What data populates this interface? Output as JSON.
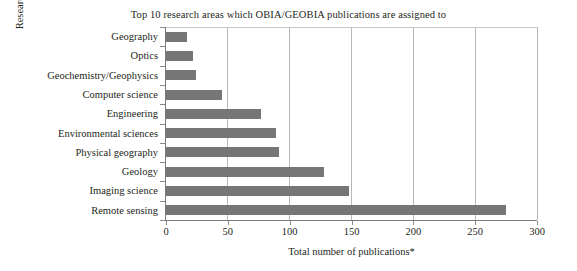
{
  "chart_data": {
    "type": "bar",
    "orientation": "horizontal",
    "title": "Top 10 research areas which OBIA/GEOBIA publications are assigned to",
    "xlabel": "Total number of publications*",
    "ylabel": "Research area",
    "categories": [
      "Geography",
      "Optics",
      "Geochemistry/Geophysics",
      "Computer science",
      "Engineering",
      "Environmental sciences",
      "Physical geography",
      "Geology",
      "Imaging science",
      "Remote sensing"
    ],
    "values": [
      17,
      22,
      24,
      45,
      77,
      89,
      91,
      128,
      148,
      275
    ],
    "xlim": [
      0,
      300
    ],
    "xticks": [
      0,
      50,
      100,
      150,
      200,
      250,
      300
    ],
    "xtick_labels": [
      "0",
      "50",
      "100",
      "150",
      "200",
      "250",
      "300"
    ],
    "grid": "vertical",
    "legend": "none",
    "bar_color": "#767676",
    "gridline_color": "#b8b8b8",
    "axis_color": "#7a7a7a",
    "background": "#ffffff"
  }
}
